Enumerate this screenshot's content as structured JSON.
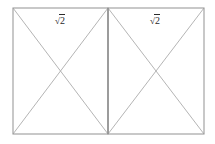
{
  "figure": {
    "type": "geometry-diagram",
    "background_color": "#ffffff",
    "line_color": "#a8a8a8",
    "border_color": "#9a9a9a",
    "label_color": "#2b2b2b",
    "outer_rect": {
      "x": 13,
      "y": 8,
      "width": 191,
      "height": 126
    },
    "divider_x": 108,
    "panels": [
      {
        "id": "left-panel",
        "label": {
          "radical": "√",
          "radicand": "2",
          "full": "√2"
        },
        "rect": {
          "x": 13,
          "y": 8,
          "width": 95,
          "height": 126
        },
        "diagonals": [
          "top-left-to-bottom-right",
          "top-right-to-bottom-left"
        ]
      },
      {
        "id": "right-panel",
        "label": {
          "radical": "√",
          "radicand": "2",
          "full": "√2"
        },
        "rect": {
          "x": 108,
          "y": 8,
          "width": 96,
          "height": 126
        },
        "diagonals": [
          "top-left-to-bottom-right",
          "top-right-to-bottom-left"
        ]
      }
    ]
  }
}
